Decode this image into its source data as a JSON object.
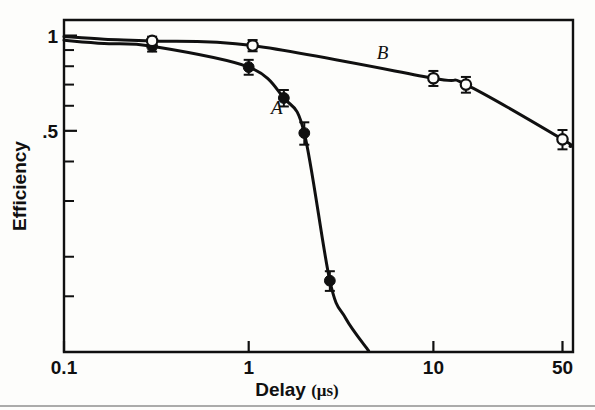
{
  "figure": {
    "background_color": "#fdfdfb",
    "ink_color": "#101010",
    "frame": {
      "left": 64,
      "top": 20,
      "right": 573,
      "bottom": 352
    },
    "bottom_rule_visible": true
  },
  "axes": {
    "x": {
      "label": "Delay",
      "unit": "(μs)",
      "unit_prefix": "(",
      "unit_symbol": "μ",
      "unit_suffix": "s)",
      "scale": "log",
      "range": [
        0.1,
        57
      ],
      "tick_labels": [
        "0.1",
        "1",
        "10",
        "50"
      ],
      "tick_values": [
        0.1,
        1,
        10,
        50
      ]
    },
    "y": {
      "label": "Efficiency",
      "scale": "log",
      "range": [
        0.1,
        1.12
      ],
      "tick_labels": [
        "1",
        ".5"
      ],
      "tick_values": [
        1,
        0.5
      ],
      "minor_tick_values": [
        0.9,
        0.8,
        0.7,
        0.6,
        0.4,
        0.3,
        0.2,
        0.15
      ]
    }
  },
  "chart_data": {
    "type": "line",
    "title": "",
    "xlabel": "Delay (μs)",
    "ylabel": "Efficiency",
    "xscale": "log",
    "yscale": "log",
    "xlim": [
      0.1,
      57
    ],
    "ylim": [
      0.1,
      1.12
    ],
    "grid": false,
    "legend": "inline-curve-labels",
    "series": [
      {
        "name": "A",
        "marker": "filled-circle",
        "label_position": {
          "x": 1.42,
          "y": 0.565
        },
        "points": [
          {
            "x": 0.3,
            "y": 0.925,
            "yerr": 0.035
          },
          {
            "x": 1.0,
            "y": 0.795,
            "yerr": 0.043
          },
          {
            "x": 1.55,
            "y": 0.635,
            "yerr": 0.038
          },
          {
            "x": 2.0,
            "y": 0.492,
            "yerr": 0.04
          },
          {
            "x": 2.75,
            "y": 0.168,
            "yerr": 0.012
          }
        ]
      },
      {
        "name": "B",
        "marker": "open-circle",
        "label_position": {
          "x": 5.3,
          "y": 0.845
        },
        "points": [
          {
            "x": 0.3,
            "y": 0.962,
            "yerr": 0.03
          },
          {
            "x": 1.05,
            "y": 0.93,
            "yerr": 0.038
          },
          {
            "x": 10.0,
            "y": 0.733,
            "yerr": 0.04
          },
          {
            "x": 15.0,
            "y": 0.7,
            "yerr": 0.04
          },
          {
            "x": 50.0,
            "y": 0.47,
            "yerr": 0.033
          }
        ]
      }
    ]
  }
}
